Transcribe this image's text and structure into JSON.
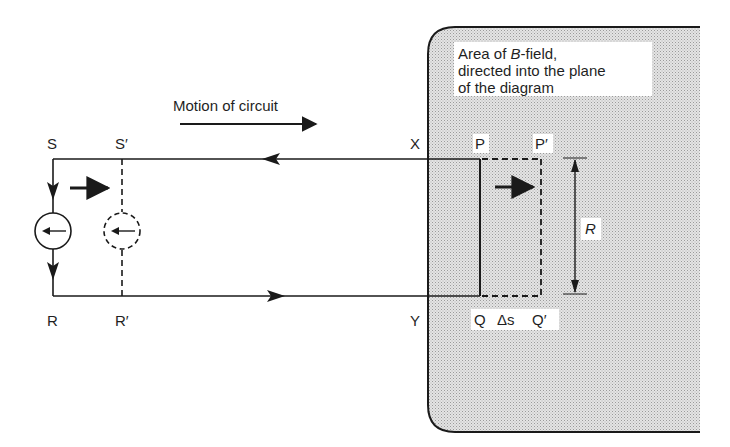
{
  "diagram": {
    "field_region": {
      "caption_lines": [
        "Area of B-field,",
        "directed into the plane",
        "of the diagram"
      ],
      "caption_parts": {
        "prefix": "Area of ",
        "symbol": "B",
        "suffix": "-field,"
      },
      "fill_color": "#cfcfcf",
      "border_color": "#1a1a1a"
    },
    "motion_label": "Motion of circuit",
    "points": {
      "S": "S",
      "S_prime": "S′",
      "R": "R",
      "R_prime": "R′",
      "X": "X",
      "Y": "Y",
      "P": "P",
      "P_prime": "P′",
      "Q": "Q",
      "Q_prime": "Q′"
    },
    "displacement_label": "Δs",
    "rod_length_label": "R",
    "line_color": "#1a1a1a"
  }
}
